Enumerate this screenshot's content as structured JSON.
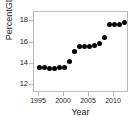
{
  "chart_data": {
    "type": "scatter",
    "title": "",
    "xlabel": "Year",
    "ylabel": "PercentGDP",
    "xlim": [
      1994.0,
      2013.0
    ],
    "ylim": [
      11.2,
      18.9
    ],
    "xticks": [
      1995,
      2000,
      2005,
      2010
    ],
    "yticks": [
      12,
      14,
      16,
      18
    ],
    "xtick_labels": [
      "1995",
      "2000",
      "2005",
      "2010"
    ],
    "ytick_labels": [
      "12",
      "14",
      "16",
      "18"
    ],
    "grid": false,
    "legend": null,
    "marker": {
      "shape": "circle",
      "filled": true,
      "color": "#000000",
      "size_px": 5
    },
    "axis_color": "#b9b9b9",
    "series": [
      {
        "name": "PercentGDP",
        "x": [
          1995,
          1996,
          1997,
          1998,
          1999,
          2000,
          2001,
          2002,
          2003,
          2004,
          2005,
          2006,
          2007,
          2008,
          2009,
          2010,
          2011,
          2012
        ],
        "y": [
          13.6,
          13.6,
          13.5,
          13.5,
          13.6,
          13.6,
          14.2,
          15.1,
          15.6,
          15.6,
          15.6,
          15.7,
          15.9,
          16.5,
          17.7,
          17.7,
          17.7,
          17.9
        ]
      }
    ]
  }
}
